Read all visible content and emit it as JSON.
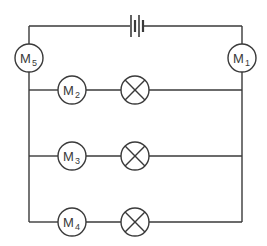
{
  "diagram": {
    "type": "circuit",
    "stroke_color": "#3a3a3a",
    "background": "#ffffff",
    "battery": {
      "name": "battery",
      "cells": 2
    },
    "meters": [
      {
        "id": "M1",
        "letter": "M",
        "sub": "1",
        "position": "main-right"
      },
      {
        "id": "M2",
        "letter": "M",
        "sub": "2",
        "position": "branch-1"
      },
      {
        "id": "M3",
        "letter": "M",
        "sub": "3",
        "position": "branch-2"
      },
      {
        "id": "M4",
        "letter": "M",
        "sub": "4",
        "position": "branch-3"
      },
      {
        "id": "M5",
        "letter": "M",
        "sub": "5",
        "position": "main-left"
      }
    ],
    "lamps": [
      {
        "id": "lamp-1",
        "branch": 1
      },
      {
        "id": "lamp-2",
        "branch": 2
      },
      {
        "id": "lamp-3",
        "branch": 3
      }
    ],
    "branches": [
      {
        "meter": "M2",
        "lamp": "lamp-1"
      },
      {
        "meter": "M3",
        "lamp": "lamp-2"
      },
      {
        "meter": "M4",
        "lamp": "lamp-3"
      }
    ]
  }
}
